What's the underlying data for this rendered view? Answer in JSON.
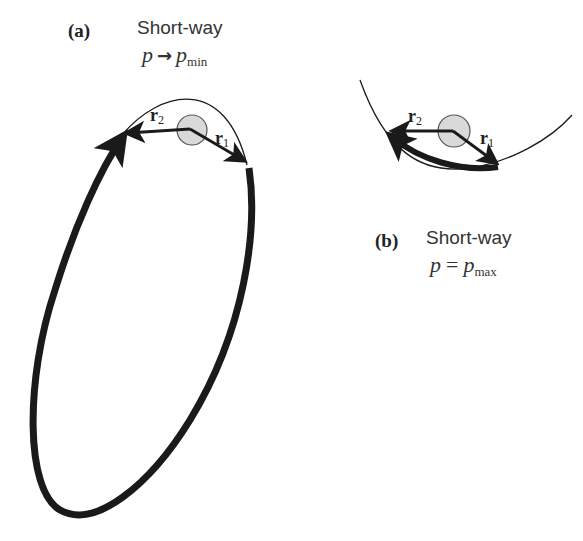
{
  "panel_a": {
    "label": "(a)",
    "title": "Short-way",
    "eq_lhs": "p",
    "eq_op": "→",
    "eq_rhs": "p",
    "eq_rhs_sub": "min",
    "vectors": [
      {
        "name": "r",
        "sub": "2"
      },
      {
        "name": "r",
        "sub": "1"
      }
    ]
  },
  "panel_b": {
    "label": "(b)",
    "title": "Short-way",
    "eq_lhs": "p",
    "eq_op": "=",
    "eq_rhs": "p",
    "eq_rhs_sub": "max",
    "vectors": [
      {
        "name": "r",
        "sub": "2"
      },
      {
        "name": "r",
        "sub": "1"
      }
    ]
  },
  "colors": {
    "stroke": "#1a1a1a",
    "focus_fill": "#d9d9d9",
    "focus_stroke": "#555555"
  }
}
